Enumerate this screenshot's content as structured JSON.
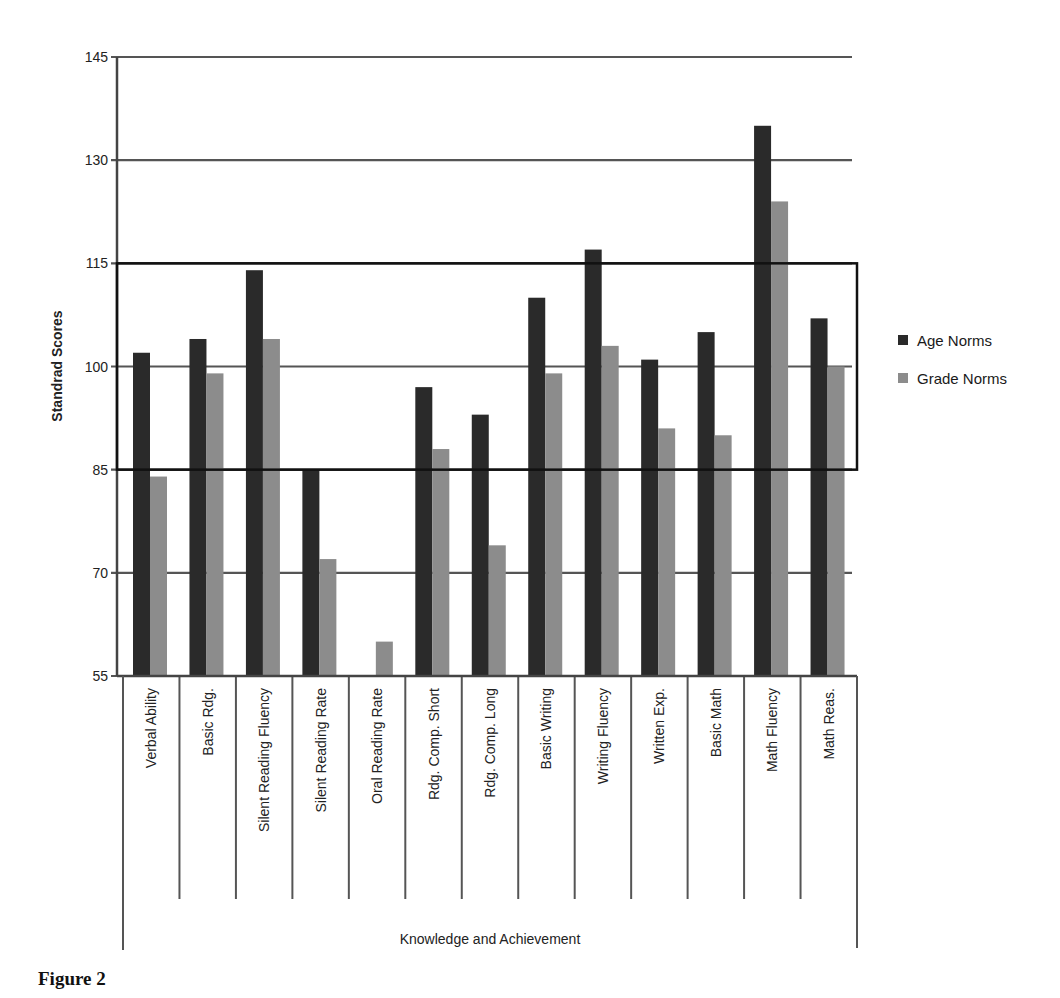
{
  "figure": {
    "caption": "Figure 2"
  },
  "legend": {
    "items": [
      {
        "label": "Age Norms",
        "color": "#2a2a2a"
      },
      {
        "label": "Grade Norms",
        "color": "#8c8c8c"
      }
    ]
  },
  "chart_data": {
    "type": "bar",
    "title": "",
    "xlabel": "Knowledge and Achievement",
    "ylabel": "Standrad Scores",
    "ylim": [
      55,
      145
    ],
    "yticks": [
      55,
      70,
      85,
      100,
      115,
      130,
      145
    ],
    "grid": true,
    "legend_position": "right",
    "annotations": [
      "Average range box from 85 to 115"
    ],
    "categories": [
      "Verbal Ability",
      "Basic Rdg.",
      "Silent Reading Fluency",
      "Silent Reading Rate",
      "Oral Reading Rate",
      "Rdg. Comp. Short",
      "Rdg. Comp. Long",
      "Basic Writing",
      "Writing Fluency",
      "Written Exp.",
      "Basic Math",
      "Math Fluency",
      "Math Reas."
    ],
    "series": [
      {
        "name": "Age Norms",
        "values": [
          102,
          104,
          114,
          85,
          null,
          97,
          93,
          110,
          117,
          101,
          105,
          135,
          107
        ]
      },
      {
        "name": "Grade Norms",
        "values": [
          84,
          99,
          104,
          72,
          60,
          88,
          74,
          99,
          103,
          91,
          90,
          124,
          100
        ]
      }
    ]
  }
}
